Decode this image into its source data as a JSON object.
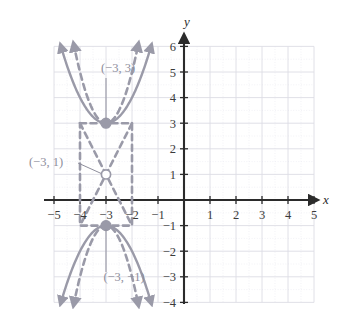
{
  "chart_data": {
    "type": "line",
    "title": "",
    "xlabel": "x",
    "ylabel": "y",
    "xlim": [
      -5.6,
      5.6
    ],
    "ylim": [
      -4.4,
      6.5
    ],
    "grid": true,
    "grid_extent": {
      "x": [
        -5,
        5
      ],
      "y": [
        -4,
        6
      ]
    },
    "x_ticks": [
      "-5",
      "-4",
      "-3",
      "-2",
      "-1",
      "1",
      "2",
      "3",
      "4",
      "5"
    ],
    "x_tick_values": [
      -5,
      -4,
      -3,
      -2,
      -1,
      1,
      2,
      3,
      4,
      5
    ],
    "y_ticks": [
      "6",
      "5",
      "4",
      "3",
      "2",
      "1",
      "-1",
      "-2",
      "-3",
      "-4"
    ],
    "y_tick_values": [
      6,
      5,
      4,
      3,
      2,
      1,
      -1,
      -2,
      -3,
      -4
    ],
    "legend": [],
    "series": [
      {
        "name": "upper-solid-parabola",
        "style": "solid",
        "color": "#9a9aa8",
        "vertex": [
          -3,
          3
        ],
        "opens": "up",
        "a": 1,
        "equation": "y = (x + 3)^2 + 3",
        "arrows": [
          "up-left",
          "up-right"
        ],
        "x_range": [
          -4.75,
          -1.25
        ]
      },
      {
        "name": "upper-dashed-parabola",
        "style": "dashed",
        "color": "#9a9aa8",
        "vertex": [
          -3,
          3
        ],
        "opens": "up",
        "a": 2,
        "equation": "y = 2(x + 3)^2 + 3",
        "arrows": [
          "up-left",
          "up-right"
        ],
        "x_range": [
          -4.25,
          -1.75
        ]
      },
      {
        "name": "lower-solid-parabola",
        "style": "solid",
        "color": "#9a9aa8",
        "vertex": [
          -3,
          -1
        ],
        "opens": "down",
        "a": -1,
        "equation": "y = -(x + 3)^2 - 1",
        "arrows": [
          "down-left",
          "down-right"
        ],
        "x_range": [
          -4.75,
          -1.25
        ]
      },
      {
        "name": "lower-dashed-parabola",
        "style": "dashed",
        "color": "#9a9aa8",
        "vertex": [
          -3,
          -1
        ],
        "opens": "down",
        "a": -2,
        "equation": "y = -2(x + 3)^2 - 1",
        "arrows": [
          "down-left",
          "down-right"
        ],
        "x_range": [
          -4.25,
          -1.75
        ]
      },
      {
        "name": "dashed-rectangle",
        "style": "dashed",
        "color": "#9a9aa8",
        "corners": [
          [
            -4,
            3
          ],
          [
            -2,
            3
          ],
          [
            -2,
            -1
          ],
          [
            -4,
            -1
          ]
        ]
      },
      {
        "name": "dashed-x-diagonals",
        "style": "dashed",
        "color": "#9a9aa8",
        "segments": [
          [
            [
              -4,
              3
            ],
            [
              -2,
              -1
            ]
          ],
          [
            [
              -2,
              3
            ],
            [
              -4,
              -1
            ]
          ]
        ],
        "crossing_point": [
          -3,
          1
        ]
      }
    ],
    "points": [
      {
        "name": "vertex-upper",
        "coords": [
          -3,
          3
        ],
        "marker": "filled-circle",
        "color": "#9a9aa8",
        "label": "(-3, 3)"
      },
      {
        "name": "vertex-lower",
        "coords": [
          -3,
          -1
        ],
        "marker": "filled-circle",
        "color": "#9a9aa8",
        "label": "(-3, -1)"
      },
      {
        "name": "midpoint-open",
        "coords": [
          -3,
          1
        ],
        "marker": "open-circle",
        "color": "#9a9aa8",
        "label": "(-3, 1)"
      }
    ],
    "annotations": [
      {
        "name": "label-upper-vertex",
        "text": "(−3, 3)",
        "target": [
          -3,
          3
        ],
        "leader": "vertical",
        "position": "above"
      },
      {
        "name": "label-open-point",
        "text": "(−3, 1)",
        "target": [
          -3,
          1
        ],
        "leader": "diagonal",
        "position": "left"
      },
      {
        "name": "label-lower-vertex",
        "text": "(−3, −1)",
        "target": [
          -3,
          -1
        ],
        "leader": "vertical",
        "position": "below"
      }
    ]
  },
  "axes": {
    "x_axis_label": "x",
    "y_axis_label": "y",
    "x_tick_labels": [
      "−5",
      "−4",
      "−3",
      "−2",
      "−1",
      "1",
      "2",
      "3",
      "4",
      "5"
    ],
    "y_tick_labels": [
      "6",
      "5",
      "4",
      "3",
      "2",
      "1",
      "−1",
      "−2",
      "−3",
      "−4"
    ]
  },
  "annotations": {
    "upper_vertex_label": "(−3, 3)",
    "open_point_label": "(−3, 1)",
    "lower_vertex_label": "(−3, −1)"
  },
  "colors": {
    "curve": "#9a9aa8",
    "axis": "#2b2b2b",
    "grid_major": "#dcdce4",
    "grid_minor": "#ececf2",
    "tick_text": "#3a3a3a",
    "annotation_text": "#8e8e9c",
    "background": "#ffffff"
  }
}
